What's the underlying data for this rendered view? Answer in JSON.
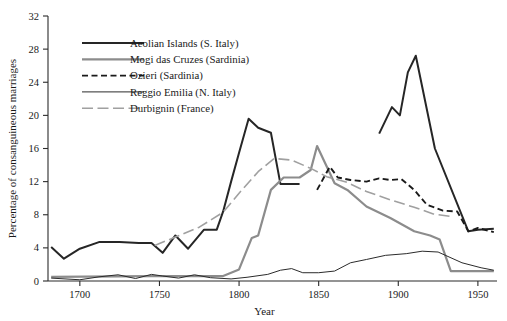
{
  "chart_data": {
    "type": "line",
    "title": "",
    "xlabel": "Year",
    "ylabel": "Percentage of consanguineous marriages",
    "xlim": [
      1680,
      1962
    ],
    "ylim": [
      0,
      32
    ],
    "xticks": [
      1700,
      1750,
      1800,
      1850,
      1900,
      1950
    ],
    "xticklabels": [
      "1700",
      "1750",
      "1800",
      "1850",
      "1900",
      "1950"
    ],
    "yticks": [
      0,
      4,
      8,
      12,
      16,
      20,
      24,
      28,
      32
    ],
    "yticklabels": [
      "0",
      "4",
      "8",
      "12",
      "16",
      "20",
      "24",
      "28",
      "32"
    ],
    "grid": false,
    "legend_position": "upper-left-inside",
    "series": [
      {
        "name": "Aeolian Islands (S. Italy)",
        "style": "solid-thick",
        "color": "#262626",
        "width": 2.0,
        "points": [
          [
            1682,
            4.1
          ],
          [
            1690,
            2.7
          ],
          [
            1700,
            3.9
          ],
          [
            1712,
            4.7
          ],
          [
            1725,
            4.7
          ],
          [
            1737,
            4.6
          ],
          [
            1745,
            4.6
          ],
          [
            1752,
            3.4
          ],
          [
            1760,
            5.5
          ],
          [
            1768,
            3.9
          ],
          [
            1778,
            6.2
          ],
          [
            1786,
            6.2
          ],
          [
            1790,
            8.4
          ],
          [
            1795,
            12.0
          ],
          [
            1800,
            15.5
          ],
          [
            1806,
            19.6
          ],
          [
            1812,
            18.5
          ],
          [
            1820,
            17.9
          ],
          [
            1826,
            11.7
          ],
          [
            1838,
            11.7
          ]
        ]
      },
      {
        "name": "Aeolian Islands (S. Italy) segment 2",
        "style": "solid-thick",
        "color": "#262626",
        "width": 2.0,
        "points": [
          [
            1888,
            17.8
          ],
          [
            1896,
            21.0
          ],
          [
            1901,
            20.0
          ],
          [
            1906,
            25.2
          ],
          [
            1911,
            27.2
          ],
          [
            1923,
            16.0
          ],
          [
            1944,
            6.0
          ],
          [
            1950,
            6.2
          ],
          [
            1960,
            6.3
          ]
        ]
      },
      {
        "name": "Mogi das Cruzes (Sardinia)",
        "style": "solid-medium",
        "color": "#8c8c8c",
        "width": 2.2,
        "points": [
          [
            1682,
            0.5
          ],
          [
            1745,
            0.6
          ],
          [
            1790,
            0.6
          ],
          [
            1800,
            1.4
          ],
          [
            1808,
            5.2
          ],
          [
            1812,
            5.5
          ],
          [
            1820,
            11.0
          ],
          [
            1828,
            12.5
          ],
          [
            1838,
            12.5
          ],
          [
            1845,
            13.4
          ],
          [
            1849,
            16.3
          ],
          [
            1860,
            11.8
          ],
          [
            1868,
            11.0
          ],
          [
            1880,
            9.0
          ],
          [
            1895,
            7.6
          ],
          [
            1910,
            6.0
          ],
          [
            1920,
            5.5
          ],
          [
            1926,
            5.0
          ],
          [
            1933,
            1.2
          ],
          [
            1950,
            1.2
          ],
          [
            1960,
            1.2
          ]
        ]
      },
      {
        "name": "Ozieri (Sardinia)",
        "style": "dashed",
        "color": "#1a1a1a",
        "width": 1.9,
        "points": [
          [
            1849,
            11.0
          ],
          [
            1853,
            12.4
          ],
          [
            1857,
            13.8
          ],
          [
            1862,
            12.5
          ],
          [
            1870,
            12.2
          ],
          [
            1880,
            12.0
          ],
          [
            1888,
            12.4
          ],
          [
            1895,
            12.2
          ],
          [
            1902,
            12.3
          ],
          [
            1910,
            11.0
          ],
          [
            1918,
            9.2
          ],
          [
            1928,
            8.5
          ],
          [
            1937,
            8.4
          ],
          [
            1944,
            6.0
          ],
          [
            1950,
            6.4
          ],
          [
            1960,
            5.9
          ]
        ]
      },
      {
        "name": "Reggio Emilia (N. Italy)",
        "style": "solid-thin",
        "color": "#2b2b2b",
        "width": 1.0,
        "points": [
          [
            1682,
            0.35
          ],
          [
            1700,
            0.15
          ],
          [
            1712,
            0.5
          ],
          [
            1724,
            0.75
          ],
          [
            1735,
            0.3
          ],
          [
            1745,
            0.8
          ],
          [
            1752,
            0.6
          ],
          [
            1762,
            0.35
          ],
          [
            1772,
            0.75
          ],
          [
            1782,
            0.4
          ],
          [
            1795,
            0.25
          ],
          [
            1805,
            0.45
          ],
          [
            1818,
            0.8
          ],
          [
            1826,
            1.3
          ],
          [
            1833,
            1.5
          ],
          [
            1840,
            1.0
          ],
          [
            1850,
            1.0
          ],
          [
            1860,
            1.2
          ],
          [
            1870,
            2.2
          ],
          [
            1880,
            2.6
          ],
          [
            1892,
            3.1
          ],
          [
            1905,
            3.3
          ],
          [
            1915,
            3.6
          ],
          [
            1925,
            3.5
          ],
          [
            1940,
            2.2
          ],
          [
            1952,
            1.6
          ],
          [
            1960,
            1.3
          ]
        ]
      },
      {
        "name": "Durbignin (France)",
        "style": "dash-long",
        "color": "#a0a0a0",
        "width": 1.6,
        "points": [
          [
            1747,
            4.3
          ],
          [
            1760,
            5.3
          ],
          [
            1775,
            6.5
          ],
          [
            1790,
            8.3
          ],
          [
            1800,
            10.6
          ],
          [
            1812,
            13.2
          ],
          [
            1822,
            14.8
          ],
          [
            1833,
            14.6
          ],
          [
            1845,
            13.6
          ],
          [
            1855,
            12.6
          ],
          [
            1868,
            11.9
          ],
          [
            1880,
            10.8
          ],
          [
            1895,
            9.8
          ],
          [
            1910,
            8.9
          ],
          [
            1922,
            8.1
          ],
          [
            1933,
            7.8
          ]
        ]
      }
    ],
    "legend": [
      {
        "label": "Aeolian Islands (S. Italy)",
        "style": "solid-thick",
        "color": "#262626"
      },
      {
        "label": "Mogi das Cruzes (Sardinia)",
        "style": "solid-medium",
        "color": "#8c8c8c"
      },
      {
        "label": "Ozieri (Sardinia)",
        "style": "dashed",
        "color": "#1a1a1a"
      },
      {
        "label": "Reggio Emilia (N. Italy)",
        "style": "solid-thin",
        "color": "#2b2b2b"
      },
      {
        "label": "Durbignin (France)",
        "style": "dash-long",
        "color": "#a0a0a0"
      }
    ]
  }
}
